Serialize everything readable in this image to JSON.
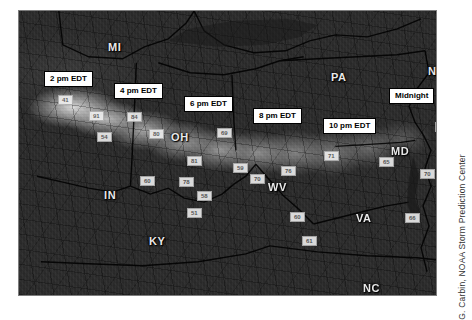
{
  "figure": {
    "attribution": "G. Carbin, NOAA Storm Prediction Center"
  },
  "map": {
    "state_labels": [
      {
        "name": "MI",
        "text": "MI",
        "x": 107,
        "y": 40
      },
      {
        "name": "PA",
        "text": "PA",
        "x": 330,
        "y": 70
      },
      {
        "name": "NJ",
        "text": "NJ",
        "x": 427,
        "y": 64
      },
      {
        "name": "OH",
        "text": "OH",
        "x": 170,
        "y": 130
      },
      {
        "name": "IN",
        "text": "IN",
        "x": 103,
        "y": 188
      },
      {
        "name": "KY",
        "text": "KY",
        "x": 148,
        "y": 234
      },
      {
        "name": "WV",
        "text": "WV",
        "x": 267,
        "y": 180
      },
      {
        "name": "MD",
        "text": "MD",
        "x": 390,
        "y": 144
      },
      {
        "name": "VA",
        "text": "VA",
        "x": 355,
        "y": 211
      },
      {
        "name": "NC",
        "text": "NC",
        "x": 362,
        "y": 281
      }
    ],
    "time_callouts": [
      {
        "name": "2-pm-edt",
        "text": "2 pm EDT",
        "x": 43,
        "y": 70
      },
      {
        "name": "4-pm-edt",
        "text": "4 pm EDT",
        "x": 113,
        "y": 82
      },
      {
        "name": "6-pm-edt",
        "text": "6 pm EDT",
        "x": 183,
        "y": 95
      },
      {
        "name": "8-pm-edt",
        "text": "8 pm EDT",
        "x": 252,
        "y": 107
      },
      {
        "name": "10-pm-edt",
        "text": "10 pm EDT",
        "x": 322,
        "y": 117
      },
      {
        "name": "midnight",
        "text": "Midnight",
        "x": 388,
        "y": 87
      }
    ],
    "gust_reports": [
      {
        "name": "gust-41",
        "text": "41",
        "x": 57,
        "y": 94
      },
      {
        "name": "gust-91",
        "text": "91",
        "x": 88,
        "y": 110
      },
      {
        "name": "gust-84",
        "text": "84",
        "x": 126,
        "y": 111
      },
      {
        "name": "gust-54",
        "text": "54",
        "x": 96,
        "y": 131
      },
      {
        "name": "gust-80",
        "text": "80",
        "x": 148,
        "y": 128
      },
      {
        "name": "gust-69",
        "text": "69",
        "x": 216,
        "y": 127
      },
      {
        "name": "gust-81",
        "text": "81",
        "x": 186,
        "y": 155
      },
      {
        "name": "gust-59",
        "text": "59",
        "x": 232,
        "y": 162
      },
      {
        "name": "gust-60",
        "text": "60",
        "x": 139,
        "y": 175
      },
      {
        "name": "gust-78",
        "text": "78",
        "x": 178,
        "y": 176
      },
      {
        "name": "gust-58",
        "text": "58",
        "x": 196,
        "y": 190
      },
      {
        "name": "gust-51",
        "text": "51",
        "x": 186,
        "y": 207
      },
      {
        "name": "gust-70a",
        "text": "70",
        "x": 249,
        "y": 173
      },
      {
        "name": "gust-76",
        "text": "76",
        "x": 280,
        "y": 165
      },
      {
        "name": "gust-71",
        "text": "71",
        "x": 323,
        "y": 150
      },
      {
        "name": "gust-65",
        "text": "65",
        "x": 378,
        "y": 156
      },
      {
        "name": "gust-74",
        "text": "74",
        "x": 434,
        "y": 121
      },
      {
        "name": "gust-70b",
        "text": "70",
        "x": 419,
        "y": 168
      },
      {
        "name": "gust-60b",
        "text": "60",
        "x": 289,
        "y": 211
      },
      {
        "name": "gust-66",
        "text": "66",
        "x": 404,
        "y": 212
      },
      {
        "name": "gust-61",
        "text": "61",
        "x": 301,
        "y": 235
      }
    ]
  }
}
